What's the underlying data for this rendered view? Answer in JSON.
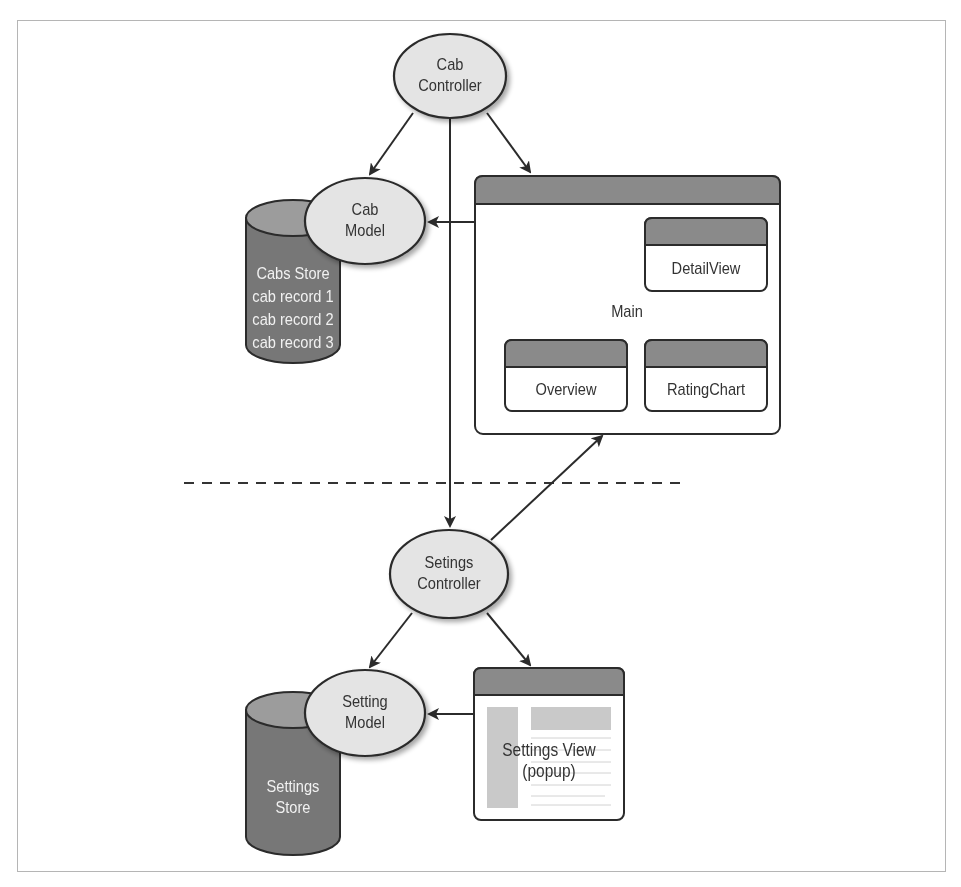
{
  "diagram": {
    "type": "architecture",
    "nodes": {
      "cab_controller": {
        "line1": "Cab",
        "line2": "Controller",
        "shape": "ellipse"
      },
      "cab_model": {
        "line1": "Cab",
        "line2": "Model",
        "shape": "ellipse"
      },
      "cabs_store": {
        "line1": "Cabs Store",
        "line2": "cab record 1",
        "line3": "cab record 2",
        "line4": "cab record 3",
        "shape": "cylinder"
      },
      "main_view": {
        "label": "Main",
        "shape": "window"
      },
      "detail_view": {
        "label": "DetailView",
        "shape": "window"
      },
      "overview": {
        "label": "Overview",
        "shape": "window"
      },
      "rating_chart": {
        "label": "RatingChart",
        "shape": "window"
      },
      "settings_controller": {
        "line1": "Setings",
        "line2": "Controller",
        "shape": "ellipse"
      },
      "setting_model": {
        "line1": "Setting",
        "line2": "Model",
        "shape": "ellipse"
      },
      "settings_store": {
        "line1": "Settings",
        "line2": "Store",
        "shape": "cylinder"
      },
      "settings_view": {
        "line1": "Settings View",
        "line2": "(popup)",
        "shape": "window"
      }
    },
    "edges": [
      {
        "from": "Cab Controller",
        "to": "Cab Model"
      },
      {
        "from": "Cab Controller",
        "to": "Main"
      },
      {
        "from": "Cab Controller",
        "to": "Setings Controller"
      },
      {
        "from": "Main",
        "to": "Cab Model"
      },
      {
        "from": "Setings Controller",
        "to": "Main"
      },
      {
        "from": "Setings Controller",
        "to": "Setting Model"
      },
      {
        "from": "Setings Controller",
        "to": "Settings View (popup)"
      },
      {
        "from": "Settings View (popup)",
        "to": "Setting Model"
      }
    ],
    "colors": {
      "ellipse_fill": "#e4e4e4",
      "store_fill": "#767676",
      "store_top": "#9a9a9a",
      "window_header": "#8a8a8a",
      "stroke": "#2b2b2b",
      "separator": "#333333"
    }
  }
}
